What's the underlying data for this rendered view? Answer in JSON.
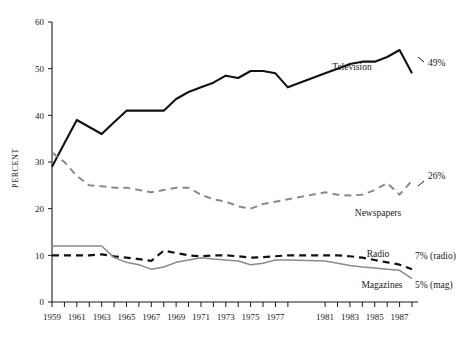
{
  "chart_data": {
    "type": "line",
    "title": "",
    "subtitle": "",
    "xlabel": "",
    "ylabel": "PERCENT",
    "xlim": [
      1959,
      1988
    ],
    "ylim": [
      0,
      60
    ],
    "grid": false,
    "legend_position": "inline-labels",
    "y_ticks": [
      0,
      10,
      20,
      30,
      40,
      50,
      60
    ],
    "y_tick_labels": [
      "0",
      "10",
      "20",
      "30",
      "40",
      "50",
      "60"
    ],
    "x_ticks": [
      1959,
      1960,
      1961,
      1962,
      1963,
      1964,
      1965,
      1966,
      1967,
      1968,
      1969,
      1970,
      1971,
      1972,
      1973,
      1974,
      1975,
      1976,
      1977,
      1978,
      1981,
      1982,
      1983,
      1984,
      1985,
      1986,
      1987,
      1988
    ],
    "x_tick_labels": [
      "1959",
      "1961",
      "1963",
      "1965",
      "1967",
      "1969",
      "1971",
      "1973",
      "1975",
      "1977",
      "1981",
      "1983",
      "1985",
      "1987"
    ],
    "x": [
      1959,
      1960,
      1961,
      1962,
      1963,
      1964,
      1965,
      1966,
      1967,
      1968,
      1969,
      1970,
      1971,
      1972,
      1973,
      1974,
      1975,
      1976,
      1977,
      1978,
      1981,
      1982,
      1983,
      1984,
      1985,
      1986,
      1987,
      1988
    ],
    "series": [
      {
        "name": "Television",
        "style": "solid",
        "color": "#111111",
        "width": 2.1,
        "label": "Television",
        "end_label": "49%",
        "values": [
          29,
          34,
          39,
          37.5,
          36,
          38.5,
          41,
          41,
          41,
          41,
          43.5,
          45,
          46,
          47,
          48.5,
          48,
          49.5,
          49.5,
          49,
          46,
          49,
          50,
          51,
          51.5,
          51.5,
          52.5,
          54,
          49
        ]
      },
      {
        "name": "Newspapers",
        "style": "dashed",
        "color": "#8a8a8a",
        "width": 2.0,
        "label": "Newspapers",
        "end_label": "26%",
        "values": [
          32,
          30,
          27,
          25,
          24.8,
          24.5,
          24.5,
          24,
          23.5,
          24,
          24.5,
          24.5,
          23,
          22,
          21.5,
          20.5,
          20,
          21,
          21.5,
          22,
          23.5,
          23,
          22.8,
          23,
          24,
          25.5,
          23,
          26
        ]
      },
      {
        "name": "Radio",
        "style": "dashed",
        "color": "#111111",
        "width": 2.2,
        "label": "Radio",
        "end_label": "7% (radio)",
        "values": [
          10,
          10,
          10,
          10,
          10.2,
          9.8,
          9.5,
          9.2,
          8.8,
          11,
          10.5,
          10,
          9.8,
          10,
          10,
          9.8,
          9.5,
          9.6,
          9.8,
          10,
          10,
          10,
          9.8,
          9.5,
          9,
          8.5,
          8,
          7
        ]
      },
      {
        "name": "Magazines",
        "style": "solid",
        "color": "#8a8a8a",
        "width": 1.5,
        "label": "Magazines",
        "end_label": "5% (mag)",
        "values": [
          12,
          12,
          12,
          12,
          12,
          9.5,
          8.5,
          8,
          7,
          7.5,
          8.5,
          9,
          9.5,
          9.2,
          9,
          8.8,
          8,
          8.3,
          9,
          9,
          8.8,
          8.3,
          7.8,
          7.5,
          7.3,
          7,
          6.8,
          5
        ]
      }
    ],
    "annotations": [
      {
        "name": "television-series-label",
        "text": "Television"
      },
      {
        "name": "newspapers-series-label",
        "text": "Newspapers"
      },
      {
        "name": "radio-series-label",
        "text": "Radio"
      },
      {
        "name": "magazines-series-label",
        "text": "Magazines"
      },
      {
        "name": "television-end-value",
        "text": "49%"
      },
      {
        "name": "newspapers-end-value",
        "text": "26%"
      },
      {
        "name": "radio-end-value",
        "text": "7% (radio)"
      },
      {
        "name": "magazines-end-value",
        "text": "5% (mag)"
      }
    ]
  }
}
